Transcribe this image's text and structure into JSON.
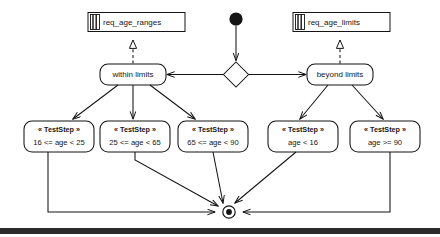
{
  "diagram": {
    "type": "uml-activity-diagram",
    "colors": {
      "stroke": "#141414",
      "fill": "#ffffff",
      "text": "#161616",
      "frame_bar": "#2c2c2c"
    }
  },
  "artifacts": [
    {
      "id": "req-age-ranges",
      "label": "req_age_ranges",
      "icon": "requirement-icon"
    },
    {
      "id": "req-age-limits",
      "label": "req_age_limits",
      "icon": "requirement-icon"
    }
  ],
  "control_nodes": {
    "initial": {
      "id": "initial-node",
      "name": "initial-node"
    },
    "decision": {
      "id": "decision-node",
      "name": "decision-diamond"
    },
    "final": {
      "id": "final-node",
      "name": "activity-final-node"
    }
  },
  "actions": [
    {
      "id": "within-limits",
      "label": "within limits"
    },
    {
      "id": "beyond-limits",
      "label": "beyond limits"
    }
  ],
  "test_steps": [
    {
      "id": "step-16-25",
      "stereotype": "« TestStep »",
      "condition": "16 <= age < 25"
    },
    {
      "id": "step-25-65",
      "stereotype": "« TestStep »",
      "condition": "25 <= age < 65"
    },
    {
      "id": "step-65-90",
      "stereotype": "« TestStep »",
      "condition": "65 <= age < 90"
    },
    {
      "id": "step-under-16",
      "stereotype": "« TestStep »",
      "condition": "age < 16"
    },
    {
      "id": "step-over-90",
      "stereotype": "« TestStep »",
      "condition": "age >= 90"
    }
  ]
}
